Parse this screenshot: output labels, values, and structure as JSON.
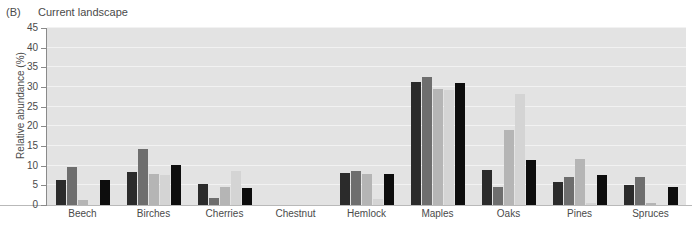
{
  "panel": {
    "letter": "(B)",
    "title": "Current landscape"
  },
  "chart_data": {
    "type": "bar",
    "title": "Current landscape",
    "xlabel": "",
    "ylabel": "Relative abundance (%)",
    "ylim": [
      0,
      45
    ],
    "yticks": [
      0,
      5,
      10,
      15,
      20,
      25,
      30,
      35,
      40,
      45
    ],
    "grid": true,
    "legend": "none",
    "categories": [
      "Beech",
      "Birches",
      "Cherries",
      "Chestnut",
      "Hemlock",
      "Maples",
      "Oaks",
      "Pines",
      "Spruces"
    ],
    "series": [
      {
        "name": "series-1",
        "color": "#2b2b2b",
        "values": [
          6.3,
          8.3,
          5.3,
          0,
          8.1,
          31.2,
          8.9,
          5.8,
          5.2
        ]
      },
      {
        "name": "series-2",
        "color": "#6e6e6e",
        "values": [
          9.7,
          14.2,
          1.9,
          0,
          8.6,
          32.5,
          4.7,
          7.0,
          7.2
        ]
      },
      {
        "name": "series-3",
        "color": "#b5b5b5",
        "values": [
          1.3,
          7.9,
          4.6,
          0,
          7.9,
          29.5,
          19.0,
          11.8,
          0.4
        ]
      },
      {
        "name": "series-4",
        "color": "#d4d4d4",
        "values": [
          0.0,
          7.6,
          8.6,
          0,
          1.5,
          29.3,
          28.1,
          0.6,
          0.0
        ]
      },
      {
        "name": "series-5",
        "color": "#0d0d0d",
        "values": [
          6.4,
          10.2,
          4.4,
          0,
          7.9,
          31.1,
          11.5,
          7.7,
          4.6
        ]
      }
    ]
  },
  "axis": {
    "tick_labels": [
      "45",
      "40",
      "35",
      "30",
      "25",
      "20",
      "15",
      "10",
      "5",
      "0"
    ]
  }
}
